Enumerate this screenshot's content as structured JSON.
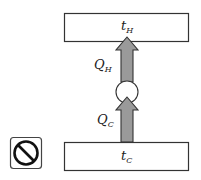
{
  "diagram": {
    "hot_reservoir": {
      "symbol": "t",
      "subscript": "H"
    },
    "cold_reservoir": {
      "symbol": "t",
      "subscript": "C"
    },
    "heat_out": {
      "symbol": "Q",
      "subscript": "H"
    },
    "heat_in": {
      "symbol": "Q",
      "subscript": "C"
    },
    "device": "circle-engine",
    "status_icon": "prohibited-icon",
    "colors": {
      "arrow_fill": "#9a9a9a",
      "stroke": "#333333"
    }
  }
}
